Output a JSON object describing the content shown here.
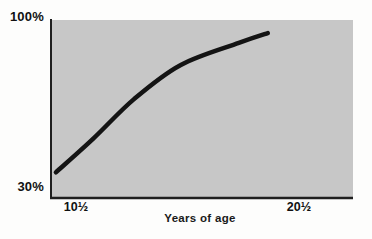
{
  "chart": {
    "y_axis": {
      "top_label": "100%",
      "bottom_label": "30%"
    },
    "x_axis": {
      "left_label": "10½",
      "right_label": "20½",
      "title": "Years of age"
    },
    "colors": {
      "plot_background": "#c7c7c7",
      "curve": "#141414",
      "axis": "#1f1f1f",
      "page_background": "#fdfdfc",
      "text": "#111111"
    }
  },
  "chart_data": {
    "type": "line",
    "title": "",
    "xlabel": "Years of age",
    "ylabel": "",
    "x_tick_labels": [
      "10½",
      "20½"
    ],
    "x_tick_values": [
      10.5,
      20.5
    ],
    "y_tick_labels": [
      "30%",
      "100%"
    ],
    "y_tick_values": [
      30,
      100
    ],
    "xlim": [
      9.4,
      22.9
    ],
    "ylim": [
      26,
      99
    ],
    "grid": false,
    "legend": false,
    "series": [
      {
        "name": "growth-curve",
        "x": [
          9.6,
          11.3,
          13.1,
          15.2,
          17.8,
          19.1
        ],
        "y": [
          36,
          50,
          66,
          80,
          89,
          93
        ]
      }
    ]
  }
}
